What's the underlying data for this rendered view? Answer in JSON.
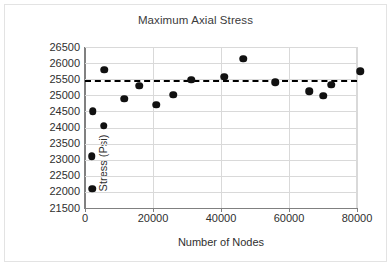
{
  "chart_data": {
    "type": "scatter",
    "title": "Maximum Axial Stress",
    "xlabel": "Number of Nodes",
    "ylabel": "Stress (Psi)",
    "xlim": [
      0,
      80000
    ],
    "ylim": [
      21500,
      26500
    ],
    "xticks": [
      0,
      20000,
      40000,
      60000,
      80000
    ],
    "xtick_labels": [
      "0",
      "20000",
      "40000",
      "60000",
      "80000"
    ],
    "yticks": [
      21500,
      22000,
      22500,
      23000,
      23500,
      24000,
      24500,
      25000,
      25500,
      26000,
      26500
    ],
    "ytick_labels": [
      "21500",
      "22000",
      "22500",
      "23000",
      "23500",
      "24000",
      "24500",
      "25000",
      "25500",
      "26000",
      "26500"
    ],
    "grid": true,
    "legend": null,
    "marker_color": "#111111",
    "grid_color": "#d9d9d9",
    "axis_color": "#808080",
    "points": [
      {
        "x": 2200,
        "y": 22100
      },
      {
        "x": 2000,
        "y": 23100
      },
      {
        "x": 2300,
        "y": 24500
      },
      {
        "x": 5500,
        "y": 24050
      },
      {
        "x": 5600,
        "y": 25800
      },
      {
        "x": 11600,
        "y": 24900
      },
      {
        "x": 16000,
        "y": 25300
      },
      {
        "x": 21000,
        "y": 24700
      },
      {
        "x": 26000,
        "y": 25010
      },
      {
        "x": 31300,
        "y": 25480
      },
      {
        "x": 41000,
        "y": 25570
      },
      {
        "x": 46500,
        "y": 26130
      },
      {
        "x": 56000,
        "y": 25400
      },
      {
        "x": 66000,
        "y": 25120
      },
      {
        "x": 70000,
        "y": 24980
      },
      {
        "x": 72400,
        "y": 25320
      },
      {
        "x": 81000,
        "y": 25740
      }
    ],
    "trendline": {
      "style": "dashed",
      "color": "#000000",
      "value": 25460,
      "label": ""
    }
  }
}
